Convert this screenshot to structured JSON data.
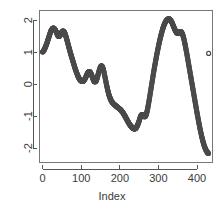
{
  "chart_data": {
    "type": "scatter",
    "title": "",
    "subtitle": "",
    "xlabel": "Index",
    "ylabel": "",
    "xlim": [
      -8,
      440
    ],
    "ylim": [
      -2.45,
      2.3
    ],
    "xticks": [
      0,
      100,
      200,
      300,
      400
    ],
    "xticklabels": [
      "0",
      "100",
      "200",
      "300",
      "400"
    ],
    "yticks": [
      -2,
      -1,
      0,
      1,
      2
    ],
    "yticklabels": [
      "-2",
      "-1",
      "0",
      "1",
      "2"
    ],
    "grid": false,
    "legend": false,
    "marker": "open-circle",
    "marker_size": 2.0,
    "series_color": "#4a4a4a",
    "box_color": "#777777",
    "axis_color": "#555555",
    "text_color": "#3a3a3a",
    "background": "#ffffff",
    "n_points": 432,
    "x": [
      0,
      2,
      4,
      6,
      8,
      10,
      12,
      14,
      16,
      18,
      20,
      22,
      24,
      26,
      28,
      30,
      32,
      34,
      36,
      38,
      40,
      42,
      44,
      46,
      48,
      50,
      52,
      54,
      56,
      58,
      60,
      62,
      64,
      66,
      68,
      70,
      72,
      74,
      76,
      78,
      80,
      82,
      84,
      86,
      88,
      90,
      92,
      94,
      96,
      98,
      100,
      102,
      104,
      106,
      108,
      110,
      112,
      114,
      116,
      118,
      120,
      122,
      124,
      126,
      128,
      130,
      132,
      134,
      136,
      138,
      140,
      142,
      144,
      146,
      148,
      150,
      152,
      154,
      156,
      158,
      160,
      162,
      164,
      166,
      168,
      170,
      172,
      174,
      176,
      178,
      180,
      182,
      184,
      186,
      188,
      190,
      192,
      194,
      196,
      198,
      200,
      202,
      204,
      206,
      208,
      210,
      212,
      214,
      216,
      218,
      220,
      222,
      224,
      226,
      228,
      230,
      232,
      234,
      236,
      238,
      240,
      242,
      244,
      246,
      248,
      250,
      252,
      254,
      256,
      258,
      260,
      262,
      264,
      266,
      268,
      270,
      272,
      274,
      276,
      278,
      280,
      282,
      284,
      286,
      288,
      290,
      292,
      294,
      296,
      298,
      300,
      302,
      304,
      306,
      308,
      310,
      312,
      314,
      316,
      318,
      320,
      322,
      324,
      326,
      328,
      330,
      332,
      334,
      336,
      338,
      340,
      342,
      344,
      346,
      348,
      350,
      352,
      354,
      356,
      358,
      360,
      362,
      364,
      366,
      368,
      370,
      372,
      374,
      376,
      378,
      380,
      382,
      384,
      386,
      388,
      390,
      392,
      394,
      396,
      398,
      400,
      402,
      404,
      406,
      408,
      410,
      412,
      414,
      416,
      418,
      420,
      422,
      424,
      426,
      428,
      430
    ],
    "y": [
      1.0,
      1.03,
      1.07,
      1.12,
      1.18,
      1.24,
      1.31,
      1.39,
      1.46,
      1.54,
      1.61,
      1.67,
      1.71,
      1.74,
      1.75,
      1.74,
      1.71,
      1.67,
      1.62,
      1.56,
      1.51,
      1.49,
      1.5,
      1.54,
      1.59,
      1.63,
      1.66,
      1.66,
      1.63,
      1.58,
      1.51,
      1.43,
      1.34,
      1.25,
      1.16,
      1.07,
      0.98,
      0.9,
      0.82,
      0.74,
      0.66,
      0.58,
      0.5,
      0.43,
      0.36,
      0.3,
      0.24,
      0.19,
      0.15,
      0.12,
      0.1,
      0.09,
      0.09,
      0.1,
      0.13,
      0.17,
      0.22,
      0.28,
      0.33,
      0.37,
      0.39,
      0.39,
      0.36,
      0.31,
      0.25,
      0.18,
      0.12,
      0.08,
      0.07,
      0.09,
      0.14,
      0.22,
      0.31,
      0.4,
      0.48,
      0.54,
      0.57,
      0.56,
      0.51,
      0.43,
      0.32,
      0.2,
      0.08,
      -0.04,
      -0.15,
      -0.25,
      -0.34,
      -0.41,
      -0.47,
      -0.52,
      -0.56,
      -0.59,
      -0.62,
      -0.64,
      -0.66,
      -0.68,
      -0.7,
      -0.72,
      -0.74,
      -0.76,
      -0.78,
      -0.8,
      -0.83,
      -0.86,
      -0.89,
      -0.93,
      -0.97,
      -1.01,
      -1.06,
      -1.1,
      -1.15,
      -1.19,
      -1.23,
      -1.27,
      -1.3,
      -1.33,
      -1.36,
      -1.38,
      -1.39,
      -1.4,
      -1.39,
      -1.37,
      -1.33,
      -1.28,
      -1.22,
      -1.15,
      -1.07,
      -1.0,
      -0.96,
      -0.95,
      -0.97,
      -1.0,
      -1.02,
      -1.01,
      -0.96,
      -0.88,
      -0.77,
      -0.64,
      -0.5,
      -0.35,
      -0.2,
      -0.05,
      0.1,
      0.25,
      0.4,
      0.54,
      0.68,
      0.81,
      0.94,
      1.06,
      1.18,
      1.29,
      1.4,
      1.5,
      1.59,
      1.68,
      1.76,
      1.83,
      1.89,
      1.94,
      1.98,
      2.01,
      2.03,
      2.04,
      2.04,
      2.02,
      1.99,
      1.95,
      1.9,
      1.84,
      1.78,
      1.72,
      1.67,
      1.63,
      1.6,
      1.59,
      1.6,
      1.62,
      1.64,
      1.64,
      1.62,
      1.57,
      1.5,
      1.41,
      1.3,
      1.18,
      1.05,
      0.92,
      0.78,
      0.64,
      0.5,
      0.36,
      0.22,
      0.08,
      -0.06,
      -0.2,
      -0.34,
      -0.48,
      -0.62,
      -0.76,
      -0.9,
      -1.03,
      -1.16,
      -1.29,
      -1.41,
      -1.52,
      -1.63,
      -1.73,
      -1.82,
      -1.9,
      -1.97,
      -2.03,
      -2.08,
      -2.12,
      -2.15,
      -2.17,
      -2.18,
      -2.18,
      -2.16,
      -2.12,
      -2.06,
      -1.99,
      -1.91,
      -1.83,
      -1.76,
      -1.71,
      -1.69,
      -1.7,
      -1.72,
      -1.73,
      -1.71,
      -1.66,
      -1.58,
      -1.48,
      -1.37,
      -1.25,
      -1.13,
      -1.01,
      -0.89,
      -0.77,
      -0.65,
      -0.53,
      -0.41,
      -0.29,
      -0.17,
      -0.06,
      0.05,
      0.16,
      0.26,
      0.36,
      0.45,
      0.53,
      0.61,
      0.68,
      0.74,
      0.79,
      0.84,
      0.88,
      0.91,
      0.94,
      0.96
    ]
  },
  "labels": {
    "xaxis_title": "Index"
  }
}
